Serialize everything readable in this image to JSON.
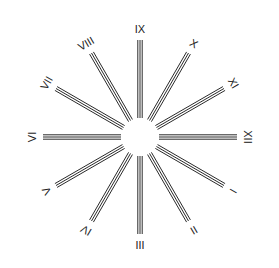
{
  "diagram": {
    "center": {
      "x": 140,
      "y": 137
    },
    "hub_radius": 16,
    "inner_radius": 19,
    "outer_radius": 97,
    "label_radius": 108,
    "line_color": "#2a2a2a",
    "background": "#ffffff",
    "spokes": [
      {
        "label": "IX",
        "angle": -90
      },
      {
        "label": "X",
        "angle": -60
      },
      {
        "label": "XI",
        "angle": -30
      },
      {
        "label": "XII",
        "angle": 0
      },
      {
        "label": "I",
        "angle": 30
      },
      {
        "label": "II",
        "angle": 60
      },
      {
        "label": "III",
        "angle": 90
      },
      {
        "label": "IV",
        "angle": 120
      },
      {
        "label": "V",
        "angle": 150
      },
      {
        "label": "VI",
        "angle": 180
      },
      {
        "label": "VII",
        "angle": 210
      },
      {
        "label": "VIII",
        "angle": 240
      }
    ]
  }
}
